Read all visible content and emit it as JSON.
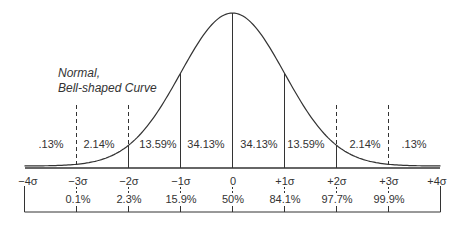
{
  "chart_data": {
    "type": "area",
    "title": "Normal, Bell-shaped Curve",
    "title_lines": [
      "Normal,",
      "Bell-shaped Curve"
    ],
    "xlabel": "",
    "ylabel": "",
    "x_ticks": [
      "−4σ",
      "−3σ",
      "−2σ",
      "−1σ",
      "0",
      "+1σ",
      "+2σ",
      "+3σ",
      "+4σ"
    ],
    "x_tick_values": [
      -4,
      -3,
      -2,
      -1,
      0,
      1,
      2,
      3,
      4
    ],
    "band_percentages": [
      {
        "from": -4,
        "to": -3,
        "label": ".13%",
        "value": 0.13
      },
      {
        "from": -3,
        "to": -2,
        "label": "2.14%",
        "value": 2.14
      },
      {
        "from": -2,
        "to": -1,
        "label": "13.59%",
        "value": 13.59
      },
      {
        "from": -1,
        "to": 0,
        "label": "34.13%",
        "value": 34.13
      },
      {
        "from": 0,
        "to": 1,
        "label": "34.13%",
        "value": 34.13
      },
      {
        "from": 1,
        "to": 2,
        "label": "13.59%",
        "value": 13.59
      },
      {
        "from": 2,
        "to": 3,
        "label": "2.14%",
        "value": 2.14
      },
      {
        "from": 3,
        "to": 4,
        "label": ".13%",
        "value": 0.13
      }
    ],
    "cumulative_percentiles": [
      {
        "at": -3,
        "label": "0.1%",
        "value": 0.1
      },
      {
        "at": -2,
        "label": "2.3%",
        "value": 2.3
      },
      {
        "at": -1,
        "label": "15.9%",
        "value": 15.9
      },
      {
        "at": 0,
        "label": "50%",
        "value": 50
      },
      {
        "at": 1,
        "label": "84.1%",
        "value": 84.1
      },
      {
        "at": 2,
        "label": "97.7%",
        "value": 97.7
      },
      {
        "at": 3,
        "label": "99.9%",
        "value": 99.9
      }
    ],
    "line_styles": {
      "sigma_1": "solid",
      "sigma_2": "solid",
      "sigma_3": "dashed"
    },
    "grid": false,
    "legend": "none",
    "colors": {
      "line": "#333333",
      "background": "#ffffff"
    }
  }
}
